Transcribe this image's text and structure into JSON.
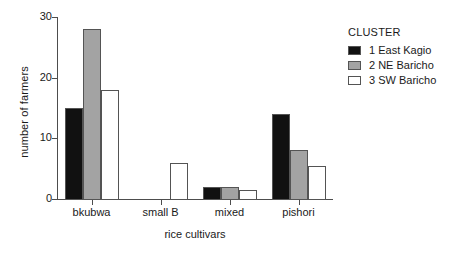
{
  "chart_data": {
    "type": "bar",
    "title": "",
    "xlabel": "rice cultivars",
    "ylabel": "number of farmers",
    "categories": [
      "bkubwa",
      "small B",
      "mixed",
      "pishori"
    ],
    "series": [
      {
        "name": "1 East Kagio",
        "values": [
          15,
          0,
          2,
          14
        ],
        "color": "#111111"
      },
      {
        "name": "2 NE Baricho",
        "values": [
          28,
          0,
          2,
          8
        ],
        "color": "#a3a3a3"
      },
      {
        "name": "3 SW Baricho",
        "values": [
          18,
          6,
          1.5,
          5.5
        ],
        "color": "#ffffff"
      }
    ],
    "ylim": [
      0,
      30
    ],
    "yticks": [
      0,
      10,
      20,
      30
    ],
    "ytick_labels": [
      "0",
      "10",
      "20",
      "30"
    ],
    "grid": false,
    "legend_position": "right",
    "legend_title": "CLUSTER"
  },
  "legend": {
    "title": "CLUSTER",
    "entries": [
      {
        "label": "1 East Kagio"
      },
      {
        "label": "2 NE Baricho"
      },
      {
        "label": "3 SW Baricho"
      }
    ]
  },
  "axes": {
    "y_label": "number of farmers",
    "x_label": "rice cultivars"
  }
}
